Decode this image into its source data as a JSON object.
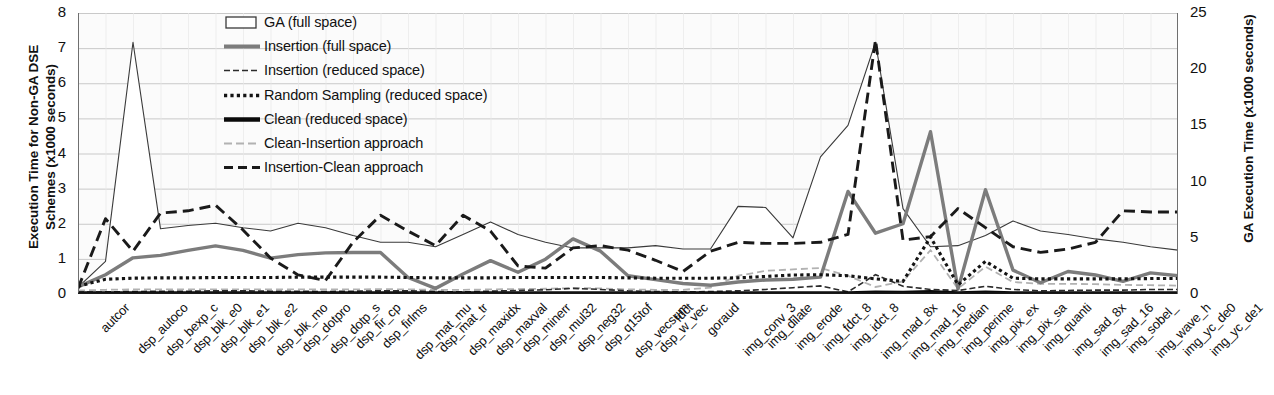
{
  "chart_data": {
    "type": "line",
    "title": "",
    "ylabel": "Execution Time for Non-GA DSE Schemes (x1000 seconds)",
    "y2label": "GA Execution Time (x1000 seconds)",
    "xlabel": "",
    "ylim": [
      0,
      8
    ],
    "y2lim": [
      0,
      25
    ],
    "yticks": [
      "0",
      "1",
      "2",
      "3",
      "4",
      "5",
      "6",
      "7",
      "8"
    ],
    "y2ticks": [
      "0",
      "5",
      "10",
      "15",
      "20",
      "25"
    ],
    "grid": true,
    "legend_position": "top-center",
    "categories": [
      "autcor",
      "dsp_autoco",
      "dsp_bexp_c",
      "dsp_blk_e0",
      "dsp_blk_e1",
      "dsp_blk_e2",
      "dsp_blk_mo",
      "dsp_dotpro",
      "dsp_dotp_s",
      "dsp_fir_cp",
      "dsp_firlms",
      "dsp_mat_mu",
      "dsp_mat_tr",
      "dsp_maxidx",
      "dsp_maxval",
      "dsp_minerr",
      "dsp_mul32",
      "dsp_neg32",
      "dsp_q15tof",
      "dsp_vecsum",
      "dsp_w_vec",
      "fdct",
      "goraud",
      "img_conv_3",
      "img_dilate",
      "img_erode",
      "img_fdct_8",
      "img_idct_8",
      "img_mad_8x",
      "img_mad_16",
      "img_median",
      "img_perime",
      "img_pix_ex",
      "img_pix_sa",
      "img_quanti",
      "img_sad_8x",
      "img_sad_16",
      "img_sobel_",
      "img_wave_h",
      "img_yc_de0",
      "img_yc_de1"
    ],
    "series": [
      {
        "name": "GA (full space)",
        "axis": "right",
        "style": "area-outline",
        "color": "#3a3a3a",
        "values": [
          0.6,
          2.9,
          22.4,
          5.8,
          6.1,
          6.3,
          5.9,
          5.6,
          6.3,
          5.9,
          5.2,
          4.6,
          4.6,
          4.2,
          5.3,
          6.4,
          5.3,
          4.6,
          4.1,
          4.1,
          4.1,
          4.3,
          4.0,
          4.0,
          7.8,
          7.7,
          5.0,
          12.2,
          15.0,
          22.4,
          7.6,
          4.2,
          4.3,
          5.2,
          6.5,
          5.6,
          5.3,
          4.9,
          4.6,
          4.2,
          3.9
        ]
      },
      {
        "name": "Insertion (full space)",
        "axis": "left",
        "style": "solid-thick-gray",
        "color": "#7c7c7c",
        "values": [
          0.2,
          0.55,
          1.03,
          1.1,
          1.24,
          1.37,
          1.24,
          1.02,
          1.12,
          1.17,
          1.18,
          1.18,
          0.47,
          0.16,
          0.57,
          0.95,
          0.62,
          0.99,
          1.57,
          1.22,
          0.52,
          0.41,
          0.3,
          0.25,
          0.34,
          0.4,
          0.42,
          0.48,
          2.92,
          1.73,
          2.0,
          4.62,
          0.14,
          2.97,
          0.68,
          0.32,
          0.64,
          0.54,
          0.36,
          0.6,
          0.52
        ]
      },
      {
        "name": "Insertion (reduced space)",
        "axis": "left",
        "style": "thin-dash",
        "color": "#2b2b2b",
        "values": [
          0.05,
          0.06,
          0.07,
          0.08,
          0.08,
          0.09,
          0.09,
          0.08,
          0.08,
          0.07,
          0.08,
          0.09,
          0.09,
          0.07,
          0.06,
          0.08,
          0.1,
          0.12,
          0.16,
          0.13,
          0.09,
          0.07,
          0.06,
          0.07,
          0.09,
          0.13,
          0.18,
          0.23,
          0.06,
          0.55,
          0.22,
          0.13,
          0.1,
          0.22,
          0.13,
          0.09,
          0.1,
          0.11,
          0.11,
          0.13,
          0.13
        ]
      },
      {
        "name": "Random Sampling (reduced space)",
        "axis": "left",
        "style": "dotted",
        "color": "#141414",
        "values": [
          0.22,
          0.42,
          0.45,
          0.46,
          0.46,
          0.47,
          0.47,
          0.47,
          0.48,
          0.48,
          0.48,
          0.48,
          0.47,
          0.46,
          0.46,
          0.46,
          0.47,
          0.47,
          0.47,
          0.47,
          0.46,
          0.45,
          0.45,
          0.45,
          0.46,
          0.5,
          0.54,
          0.55,
          0.52,
          0.43,
          0.36,
          1.62,
          0.26,
          0.93,
          0.45,
          0.43,
          0.43,
          0.43,
          0.43,
          0.44,
          0.44
        ]
      },
      {
        "name": "Clean (reduced space)",
        "axis": "left",
        "style": "solid-heavy-black",
        "color": "#0a0a0a",
        "values": [
          0.03,
          0.03,
          0.03,
          0.03,
          0.03,
          0.03,
          0.03,
          0.03,
          0.03,
          0.03,
          0.03,
          0.03,
          0.03,
          0.03,
          0.03,
          0.03,
          0.03,
          0.03,
          0.03,
          0.03,
          0.03,
          0.03,
          0.03,
          0.03,
          0.03,
          0.03,
          0.03,
          0.03,
          0.03,
          0.05,
          0.04,
          0.06,
          0.03,
          0.05,
          0.03,
          0.03,
          0.03,
          0.03,
          0.03,
          0.03,
          0.03
        ]
      },
      {
        "name": "Clean-Insertion approach",
        "axis": "left",
        "style": "light-gray-dash",
        "color": "#b2b2b2",
        "values": [
          0.1,
          0.12,
          0.13,
          0.13,
          0.13,
          0.13,
          0.13,
          0.13,
          0.13,
          0.13,
          0.13,
          0.14,
          0.13,
          0.12,
          0.12,
          0.13,
          0.14,
          0.15,
          0.17,
          0.16,
          0.13,
          0.12,
          0.12,
          0.18,
          0.52,
          0.66,
          0.7,
          0.74,
          0.52,
          0.2,
          0.36,
          1.25,
          0.15,
          0.78,
          0.34,
          0.29,
          0.29,
          0.28,
          0.26,
          0.25,
          0.24
        ]
      },
      {
        "name": "Insertion-Clean approach",
        "axis": "right",
        "style": "bold-dash",
        "color": "#1a1a1a",
        "values": [
          0.5,
          6.7,
          3.8,
          7.2,
          7.4,
          7.9,
          5.7,
          3.2,
          1.7,
          1.2,
          4.6,
          7.0,
          5.6,
          4.3,
          7.0,
          5.6,
          2.5,
          2.3,
          4.1,
          4.3,
          3.9,
          3.0,
          2.0,
          3.8,
          4.6,
          4.5,
          4.5,
          4.6,
          5.3,
          22.6,
          4.8,
          5.1,
          7.6,
          5.9,
          4.2,
          3.7,
          4.0,
          4.6,
          7.4,
          7.3,
          7.3
        ]
      }
    ]
  },
  "legend": {
    "items": [
      {
        "label": "GA (full space)",
        "key": "box-outline"
      },
      {
        "label": "Insertion (full space)",
        "key": "gray-thick-line"
      },
      {
        "label": "Insertion (reduced space)",
        "key": "thin-dashed-line"
      },
      {
        "label": "Random Sampling (reduced space)",
        "key": "dotted-line"
      },
      {
        "label": "Clean (reduced space)",
        "key": "heavy-black-line"
      },
      {
        "label": "Clean-Insertion approach",
        "key": "light-gray-dashed-line"
      },
      {
        "label": "Insertion-Clean approach",
        "key": "bold-dashed-line"
      }
    ]
  },
  "colors": {
    "ga_area_stroke": "#3a3a3a",
    "insertion_full": "#7c7c7c",
    "insertion_reduced": "#2b2b2b",
    "random_sampling": "#141414",
    "clean_reduced": "#0a0a0a",
    "clean_insertion": "#b2b2b2",
    "insertion_clean": "#1a1a1a",
    "grid": "#c9c9c9",
    "plot_bg": "#fbfbfb"
  }
}
